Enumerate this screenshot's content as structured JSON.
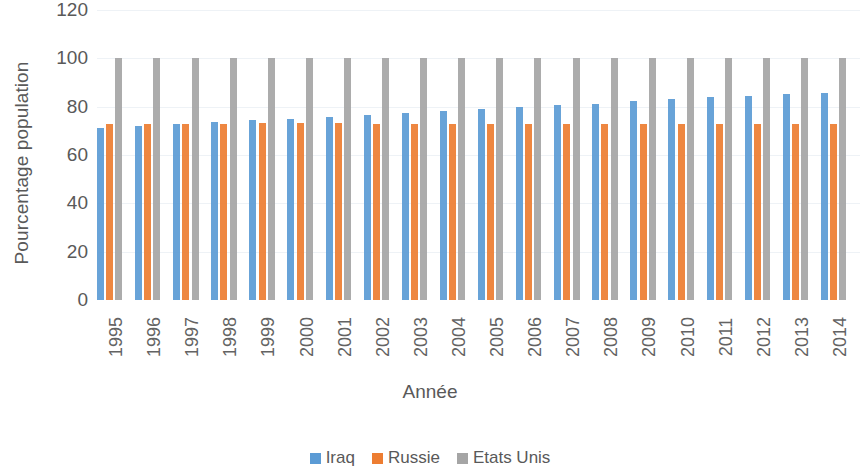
{
  "chart_data": {
    "type": "bar",
    "title": "",
    "subtitle": "",
    "xlabel": "Année",
    "ylabel": "Pourcentage population",
    "ylim": [
      0,
      120
    ],
    "yticks": [
      0,
      20,
      40,
      60,
      80,
      100,
      120
    ],
    "grid": true,
    "legend_position": "bottom",
    "clipped_right_edge": true,
    "categories": [
      "1995",
      "1996",
      "1997",
      "1998",
      "1999",
      "2000",
      "2001",
      "2002",
      "2003",
      "2004",
      "2005",
      "2006",
      "2007",
      "2008",
      "2009",
      "2010",
      "2011",
      "2012",
      "2013",
      "2014"
    ],
    "series": [
      {
        "name": "Iraq",
        "color": "#5b9bd5",
        "values": [
          71.0,
          72.0,
          72.8,
          73.5,
          74.3,
          75.0,
          75.6,
          76.5,
          77.5,
          78.3,
          79.0,
          79.8,
          80.5,
          81.3,
          82.3,
          83.0,
          83.8,
          84.5,
          85.2,
          85.5
        ]
      },
      {
        "name": "Russie",
        "color": "#ed7d31",
        "values": [
          72.7,
          72.8,
          72.9,
          73.0,
          73.1,
          73.1,
          73.1,
          73.0,
          72.9,
          72.8,
          72.8,
          72.8,
          72.8,
          72.8,
          72.8,
          72.8,
          72.8,
          72.8,
          72.8,
          72.8
        ]
      },
      {
        "name": "Etats Unis",
        "color": "#a5a5a5",
        "values": [
          100,
          100,
          100,
          100,
          100,
          100,
          100,
          100,
          100,
          100,
          100,
          100,
          100,
          100,
          100,
          100,
          100,
          100,
          100,
          100
        ]
      }
    ]
  },
  "axis": {
    "y_title": "Pourcentage population",
    "x_title": "Année",
    "y_tick_labels": [
      "120",
      "100",
      "80",
      "60",
      "40",
      "20",
      "0"
    ]
  },
  "legend": {
    "items": [
      {
        "label": "Iraq",
        "color": "#5b9bd5"
      },
      {
        "label": "Russie",
        "color": "#ed7d31"
      },
      {
        "label": "Etats Unis",
        "color": "#a5a5a5"
      }
    ]
  },
  "colors": {
    "iraq": "#5b9bd5",
    "russie": "#ed7d31",
    "etats_unis": "#a5a5a5",
    "text": "#595959",
    "gridline": "#eef2f6"
  }
}
